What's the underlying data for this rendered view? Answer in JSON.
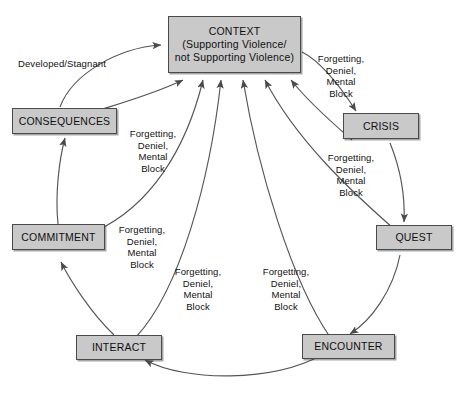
{
  "diagram": {
    "box_fill": "#c9c9c9",
    "box_border": "#4a4a4a",
    "edge_color": "#555555",
    "nodes": [
      {
        "id": "context",
        "lines": [
          "CONTEXT",
          "(Supporting Violence/",
          "not Supporting Violence)"
        ]
      },
      {
        "id": "consequences",
        "lines": [
          "CONSEQUENCES"
        ]
      },
      {
        "id": "commitment",
        "lines": [
          "COMMITMENT"
        ]
      },
      {
        "id": "interact",
        "lines": [
          "INTERACT"
        ]
      },
      {
        "id": "encounter",
        "lines": [
          "ENCOUNTER"
        ]
      },
      {
        "id": "quest",
        "lines": [
          "QUEST"
        ]
      },
      {
        "id": "crisis",
        "lines": [
          "CRISIS"
        ]
      }
    ],
    "labels": {
      "developed_stagnant": [
        "Developed/Stagnant"
      ],
      "fdmb_crisis": [
        "Forgetting,",
        "Deniel,",
        "Mental",
        "Block"
      ],
      "fdmb_consequences": [
        "Forgetting,",
        "Deniel,",
        "Mental",
        "Block"
      ],
      "fdmb_quest": [
        "Forgetting,",
        "Deniel,",
        "Mental",
        "Block"
      ],
      "fdmb_commitment": [
        "Forgetting,",
        "Deniel,",
        "Mental",
        "Block"
      ],
      "fdmb_interact": [
        "Forgetting,",
        "Deniel,",
        "Mental",
        "Block"
      ],
      "fdmb_encounter": [
        "Forgetting,",
        "Deniel,",
        "Mental",
        "Block"
      ]
    }
  }
}
